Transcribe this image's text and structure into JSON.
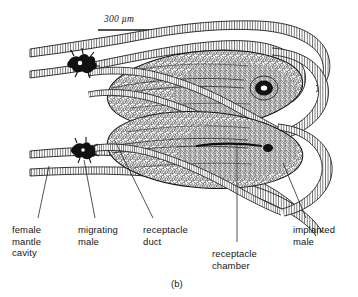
{
  "figure": {
    "panel_letter": "(b)",
    "scale_bar": {
      "label": "300 µm",
      "value": 300,
      "unit": "µm",
      "bar_x_start": 98,
      "bar_x_end": 160,
      "bar_y": 30
    },
    "background_color": "#ffffff",
    "ink_color": "#161616"
  },
  "labels": [
    {
      "id": "female-mantle-cavity",
      "text": "female\nmantle\ncavity",
      "x": 12,
      "y": 224,
      "leader": {
        "x1": 38,
        "y1": 218,
        "x2": 49,
        "y2": 166
      }
    },
    {
      "id": "migrating-male",
      "text": "migrating\nmale",
      "x": 78,
      "y": 224,
      "leader": {
        "x1": 95,
        "y1": 218,
        "x2": 84,
        "y2": 160
      }
    },
    {
      "id": "receptacle-duct",
      "text": "receptacle\nduct",
      "x": 143,
      "y": 224,
      "leader": {
        "x1": 153,
        "y1": 218,
        "x2": 115,
        "y2": 141
      }
    },
    {
      "id": "receptacle-chamber",
      "text": "receptacle\nchamber",
      "x": 212,
      "y": 248,
      "leader": {
        "x1": 237,
        "y1": 242,
        "x2": 237,
        "y2": 143
      }
    },
    {
      "id": "implanted-male",
      "text": "implanted\nmale",
      "x": 293,
      "y": 224,
      "leader": {
        "x1": 306,
        "y1": 218,
        "x2": 283,
        "y2": 163
      }
    }
  ],
  "structures": [
    {
      "id": "outer-mantle-wall-upper",
      "name": "outer mantle wall (upper)"
    },
    {
      "id": "inner-mantle-wall-upper",
      "name": "inner mantle wall (upper)"
    },
    {
      "id": "outer-mantle-wall-lower",
      "name": "outer mantle wall (lower)"
    },
    {
      "id": "inner-mantle-wall-lower",
      "name": "inner mantle wall (lower)"
    },
    {
      "id": "receptacle-duct-upper",
      "name": "upper receptacle duct"
    },
    {
      "id": "receptacle-duct-lower",
      "name": "lower receptacle duct"
    },
    {
      "id": "receptacle-chamber-upper",
      "name": "upper receptacle chamber"
    },
    {
      "id": "receptacle-chamber-lower",
      "name": "lower receptacle chamber"
    },
    {
      "id": "implanted-male-upper",
      "name": "upper implanted male body"
    },
    {
      "id": "implanted-male-lower",
      "name": "lower implanted male body"
    },
    {
      "id": "migrating-male-upper",
      "name": "upper migrating male"
    },
    {
      "id": "migrating-male-lower",
      "name": "lower migrating male"
    },
    {
      "id": "duct-loop-upper-right",
      "name": "upper right duct loop"
    },
    {
      "id": "duct-loop-lower-right",
      "name": "lower right duct loop"
    }
  ]
}
